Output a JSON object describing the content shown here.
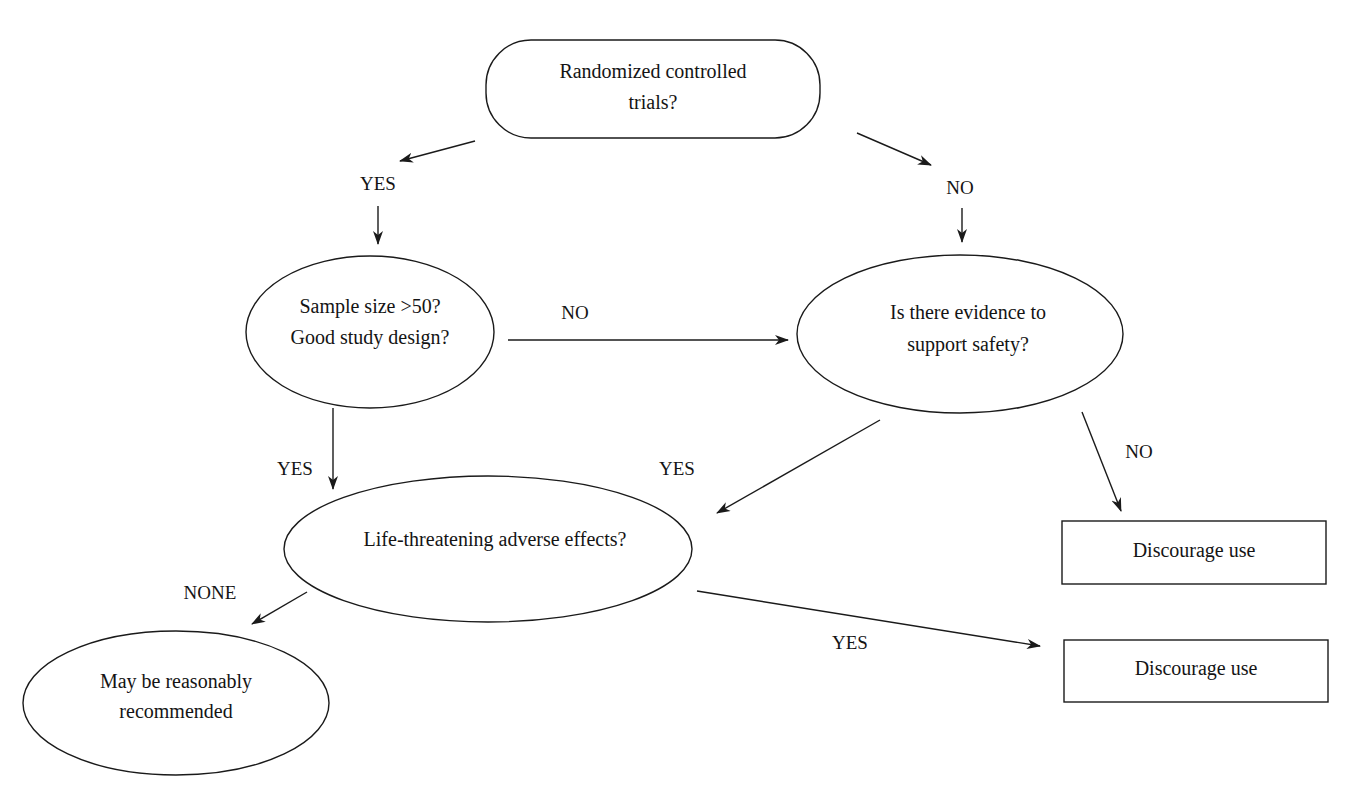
{
  "diagram": {
    "type": "flowchart",
    "nodes": {
      "rct": {
        "shape": "rounded-rectangle",
        "lines": [
          "Randomized controlled",
          "trials?"
        ]
      },
      "sample": {
        "shape": "ellipse",
        "lines": [
          "Sample size >50?",
          "Good study design?"
        ]
      },
      "safety": {
        "shape": "ellipse",
        "lines": [
          "Is there evidence to",
          "support safety?"
        ]
      },
      "life": {
        "shape": "ellipse",
        "lines": [
          "Life-threatening adverse effects?"
        ]
      },
      "discourage1": {
        "shape": "rectangle",
        "lines": [
          "Discourage use"
        ]
      },
      "discourage2": {
        "shape": "rectangle",
        "lines": [
          "Discourage use"
        ]
      },
      "recommend": {
        "shape": "ellipse",
        "lines": [
          "May be reasonably",
          "recommended"
        ]
      }
    },
    "edge_labels": {
      "rct_yes": "YES",
      "rct_no": "NO",
      "sample_no": "NO",
      "sample_yes": "YES",
      "safety_yes": "YES",
      "safety_no": "NO",
      "life_yes": "YES",
      "life_none": "NONE"
    },
    "edges": [
      {
        "from": "rct",
        "to": "sample",
        "label": "YES"
      },
      {
        "from": "rct",
        "to": "safety",
        "label": "NO"
      },
      {
        "from": "sample",
        "to": "safety",
        "label": "NO"
      },
      {
        "from": "sample",
        "to": "life",
        "label": "YES"
      },
      {
        "from": "safety",
        "to": "life",
        "label": "YES"
      },
      {
        "from": "safety",
        "to": "discourage1",
        "label": "NO"
      },
      {
        "from": "life",
        "to": "discourage2",
        "label": "YES"
      },
      {
        "from": "life",
        "to": "recommend",
        "label": "NONE"
      }
    ],
    "colors": {
      "stroke": "#1a1a1a",
      "text": "#141414",
      "background": "#ffffff"
    }
  }
}
